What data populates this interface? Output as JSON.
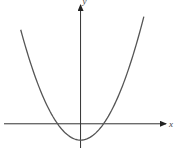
{
  "chart_data": {
    "type": "line",
    "title": "",
    "xlabel": "x",
    "ylabel": "y",
    "function": "y = x^2 - 1",
    "series": [
      {
        "name": "parabola",
        "x": [
          -2.6,
          -2,
          -1.5,
          -1,
          -0.5,
          0,
          0.5,
          1,
          1.5,
          2,
          2.75
        ],
        "y": [
          5.76,
          3,
          1.25,
          0,
          -0.75,
          -1,
          -0.75,
          0,
          1.25,
          3,
          6.56
        ]
      }
    ],
    "vertex": [
      0,
      -1
    ],
    "x_intercepts": [
      -1,
      1
    ],
    "xlim": [
      -3.5,
      3.8
    ],
    "ylim": [
      -1.3,
      7.4
    ],
    "grid": false,
    "legend": "none"
  }
}
